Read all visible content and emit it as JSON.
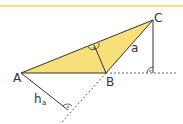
{
  "diagram": {
    "colors": {
      "fill": "#f7e07a",
      "top_rule": "#f5e27c",
      "stroke": "#333333",
      "dashed": "#555555"
    },
    "points": {
      "A": {
        "label": "A",
        "x": 21,
        "y": 73
      },
      "B": {
        "label": "B",
        "x": 106,
        "y": 73
      },
      "C": {
        "label": "C",
        "x": 153,
        "y": 20
      }
    },
    "labels": {
      "A": "A",
      "B": "B",
      "C": "C",
      "side_a": "a",
      "altitude": "h",
      "altitude_sub": "a"
    },
    "right_angle_marks": [
      {
        "at": "foot of altitude from B onto AC"
      },
      {
        "at": "foot of perpendicular from C to extension of AB"
      },
      {
        "at": "foot of h_a on extension of BC"
      }
    ]
  }
}
